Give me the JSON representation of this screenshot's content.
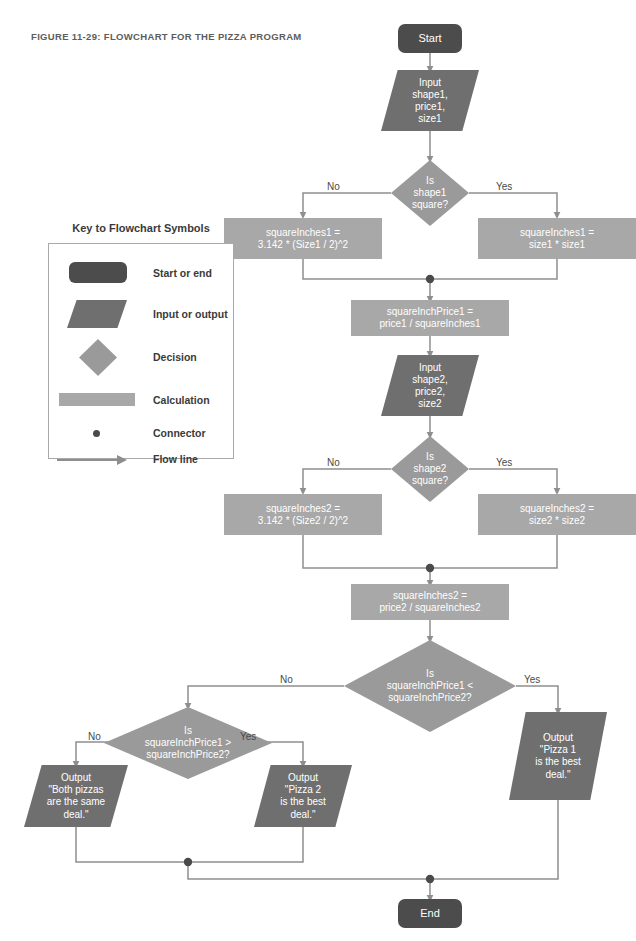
{
  "figure": {
    "title": "FIGURE 11-29: FLOWCHART FOR THE PIZZA PROGRAM"
  },
  "legend": {
    "title": "Key to Flowchart Symbols",
    "items": [
      {
        "symbol": "start-end-symbol",
        "label": "Start or end"
      },
      {
        "symbol": "input-output-symbol",
        "label": "Input or output"
      },
      {
        "symbol": "decision-symbol",
        "label": "Decision"
      },
      {
        "symbol": "calculation-symbol",
        "label": "Calculation"
      },
      {
        "symbol": "connector-symbol",
        "label": "Connector"
      },
      {
        "symbol": "flow-line-symbol",
        "label": "Flow line"
      }
    ]
  },
  "colors": {
    "terminator": "#4c4c4c",
    "input_output": "#6f6f6f",
    "decision": "#9a9a9a",
    "calculation": "#a8a8a8",
    "flow_line": "#8e8e8e",
    "connector_dot": "#4a4a4a",
    "text_on_shape": "#ffffff",
    "label_text": "#4a4a4a",
    "title_text": "#5d5d5d"
  },
  "nodes": {
    "start": "Start",
    "input1": "Input\nshape1,\nprice1,\nsize1",
    "decision1": "Is\nshape1\nsquare?",
    "calc_circle1": "squareInches1 =\n3.142 * (Size1 / 2)^2",
    "calc_square1": "squareInches1 =\nsize1 * size1",
    "calc_price1": "squareInchPrice1 =\nprice1 / squareInches1",
    "input2": "Input\nshape2,\nprice2,\nsize2",
    "decision2": "Is\nshape2\nsquare?",
    "calc_circle2": "squareInches2 =\n3.142 * (Size2 / 2)^2",
    "calc_square2": "squareInches2 =\nsize2 * size2",
    "calc_price2": "squareInches2 =\nprice2 / squareInches2",
    "decision3": "Is\nsquareInchPrice1 <\nsquareInchPrice2?",
    "decision4": "Is\nsquareInchPrice1 >\nsquareInchPrice2?",
    "output_pizza1": "Output\n\"Pizza 1\nis the best\ndeal.\"",
    "output_pizza2": "Output\n\"Pizza 2\nis the best\ndeal.\"",
    "output_same": "Output\n\"Both pizzas\nare the same\ndeal.\"",
    "end": "End"
  },
  "branch_labels": {
    "d1_no": "No",
    "d1_yes": "Yes",
    "d2_no": "No",
    "d2_yes": "Yes",
    "d3_no": "No",
    "d3_yes": "Yes",
    "d4_no": "No",
    "d4_yes": "Yes"
  }
}
